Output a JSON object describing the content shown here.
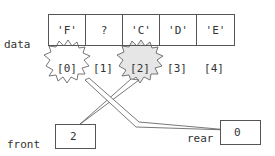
{
  "diagram": {
    "array": {
      "name": "data",
      "cells": [
        "'F'",
        "?",
        "'C'",
        "'D'",
        "'E'"
      ],
      "indices": [
        "[0]",
        "[1]",
        "[2]",
        "[3]",
        "[4]"
      ]
    },
    "front": {
      "label": "front",
      "value": "2",
      "points_to_index": "[2]"
    },
    "rear": {
      "label": "rear",
      "value": "0",
      "points_to_index": "[0]"
    },
    "colors": {
      "stroke": "#555555",
      "front_burst_fill": "#e6e6e6",
      "rear_burst_fill": "#ffffff"
    }
  }
}
